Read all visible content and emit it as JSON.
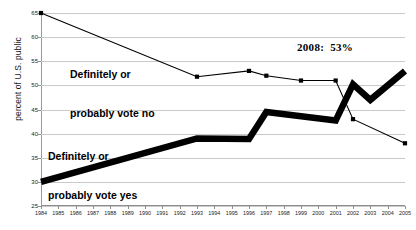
{
  "chart_data": {
    "type": "line",
    "title": "",
    "xlabel": "",
    "ylabel": "percent of U.S. public",
    "ylim": [
      25,
      65
    ],
    "xlim": [
      1984,
      2005
    ],
    "yticks": [
      25,
      30,
      35,
      40,
      45,
      50,
      55,
      60,
      65
    ],
    "grid": true,
    "legend": "inline-annotations",
    "x": [
      1984,
      1985,
      1986,
      1987,
      1988,
      1989,
      1990,
      1991,
      1992,
      1993,
      1994,
      1995,
      1996,
      1997,
      1998,
      1999,
      2000,
      2001,
      2002,
      2003,
      2004,
      2005
    ],
    "series": [
      {
        "name": "Definitely or probably vote no",
        "style": "thin-line-with-square-markers",
        "color": "#000000",
        "points": [
          {
            "x": 1984,
            "y": 65
          },
          {
            "x": 1993,
            "y": 51.8
          },
          {
            "x": 1996,
            "y": 53
          },
          {
            "x": 1997,
            "y": 52
          },
          {
            "x": 1999,
            "y": 51
          },
          {
            "x": 2001,
            "y": 51
          },
          {
            "x": 2002,
            "y": 43
          },
          {
            "x": 2005,
            "y": 38
          }
        ]
      },
      {
        "name": "Definitely or probably vote yes",
        "style": "thick-line",
        "color": "#000000",
        "points": [
          {
            "x": 1984,
            "y": 30
          },
          {
            "x": 1993,
            "y": 39
          },
          {
            "x": 1996,
            "y": 38.9
          },
          {
            "x": 1997,
            "y": 44.5
          },
          {
            "x": 2001,
            "y": 42.7
          },
          {
            "x": 2002,
            "y": 50.2
          },
          {
            "x": 2003,
            "y": 47
          },
          {
            "x": 2005,
            "y": 53
          }
        ]
      }
    ],
    "annotations": [
      {
        "name": "vote-no-label",
        "text_lines": [
          "Definitely or",
          "probably vote no"
        ]
      },
      {
        "name": "vote-yes-label",
        "text_lines": [
          "Definitely or",
          "probably vote yes"
        ]
      },
      {
        "name": "projection-2008",
        "text": "2008:  53%"
      }
    ]
  },
  "labels": {
    "ylabel": "percent of U.S. public",
    "ann_no_line1": "Definitely or",
    "ann_no_line2": "probably vote no",
    "ann_yes_line1": "Definitely or",
    "ann_yes_line2": "probably vote yes",
    "ann_2008": "2008:  53%"
  }
}
